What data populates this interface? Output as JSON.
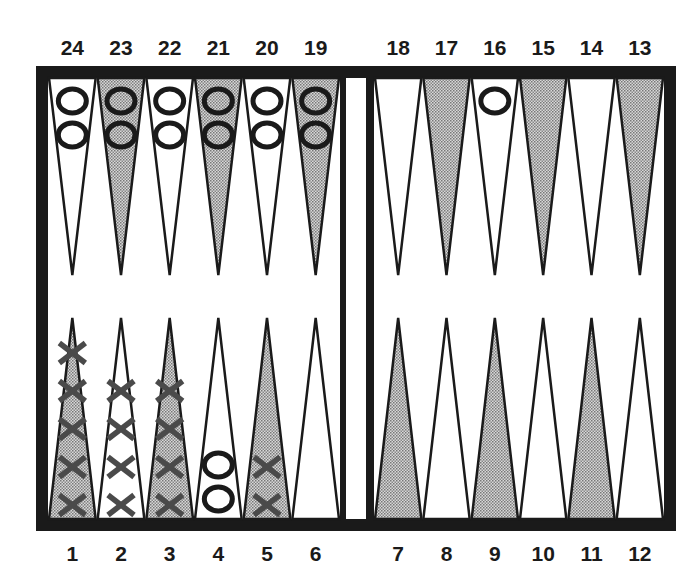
{
  "colors": {
    "frame": "#1a1a1a",
    "dark_point": "#b8b8b8",
    "light_point": "#ffffff",
    "o_checker": "#1a1a1a",
    "x_checker": "#4a4a4a"
  },
  "top_labels": [
    "24",
    "23",
    "22",
    "21",
    "20",
    "19",
    "18",
    "17",
    "16",
    "15",
    "14",
    "13"
  ],
  "bottom_labels": [
    "1",
    "2",
    "3",
    "4",
    "5",
    "6",
    "7",
    "8",
    "9",
    "10",
    "11",
    "12"
  ],
  "points": [
    {
      "point": 1,
      "shade": "dark",
      "checker": "X",
      "count": 5
    },
    {
      "point": 2,
      "shade": "light",
      "checker": "X",
      "count": 4
    },
    {
      "point": 3,
      "shade": "dark",
      "checker": "X",
      "count": 4
    },
    {
      "point": 4,
      "shade": "light",
      "checker": "O",
      "count": 2
    },
    {
      "point": 5,
      "shade": "dark",
      "checker": "X",
      "count": 2
    },
    {
      "point": 6,
      "shade": "light",
      "checker": "",
      "count": 0
    },
    {
      "point": 7,
      "shade": "dark",
      "checker": "",
      "count": 0
    },
    {
      "point": 8,
      "shade": "light",
      "checker": "",
      "count": 0
    },
    {
      "point": 9,
      "shade": "dark",
      "checker": "",
      "count": 0
    },
    {
      "point": 10,
      "shade": "light",
      "checker": "",
      "count": 0
    },
    {
      "point": 11,
      "shade": "dark",
      "checker": "",
      "count": 0
    },
    {
      "point": 12,
      "shade": "light",
      "checker": "",
      "count": 0
    },
    {
      "point": 13,
      "shade": "dark",
      "checker": "",
      "count": 0
    },
    {
      "point": 14,
      "shade": "light",
      "checker": "",
      "count": 0
    },
    {
      "point": 15,
      "shade": "dark",
      "checker": "",
      "count": 0
    },
    {
      "point": 16,
      "shade": "light",
      "checker": "O",
      "count": 1
    },
    {
      "point": 17,
      "shade": "dark",
      "checker": "",
      "count": 0
    },
    {
      "point": 18,
      "shade": "light",
      "checker": "",
      "count": 0
    },
    {
      "point": 19,
      "shade": "dark",
      "checker": "O",
      "count": 2
    },
    {
      "point": 20,
      "shade": "light",
      "checker": "O",
      "count": 2
    },
    {
      "point": 21,
      "shade": "dark",
      "checker": "O",
      "count": 2
    },
    {
      "point": 22,
      "shade": "light",
      "checker": "O",
      "count": 2
    },
    {
      "point": 23,
      "shade": "dark",
      "checker": "O",
      "count": 2
    },
    {
      "point": 24,
      "shade": "light",
      "checker": "O",
      "count": 2
    }
  ]
}
